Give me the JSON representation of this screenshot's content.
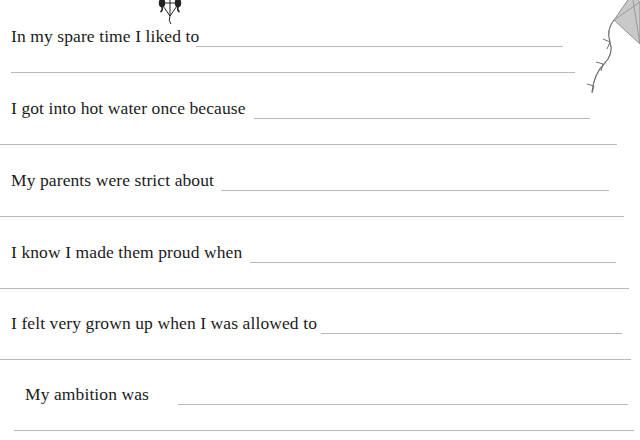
{
  "document": {
    "type": "fill-in-the-blank memory journal page",
    "page_background": "#ffffff",
    "text_color": "#1b1b1b",
    "rule_color": "#b9b9b9",
    "artwork": [
      {
        "name": "kite-small",
        "description": "small black-and-white kite with tail at top center"
      },
      {
        "name": "kite-corner",
        "description": "large grey kite with string in top right corner"
      }
    ],
    "prompts": [
      {
        "id": "spare-time",
        "label": "In my spare time I liked to",
        "label_width": 193,
        "rule_start": 196,
        "rule_end": 563,
        "second_rule": {
          "start": 11,
          "end": 575
        }
      },
      {
        "id": "hot-water",
        "label": "I got into hot water once because",
        "label_width": 241,
        "rule_start": 254,
        "rule_end": 590,
        "second_rule": {
          "start": 0,
          "end": 617
        }
      },
      {
        "id": "parents-strict",
        "label": "My parents were strict about",
        "label_width": 207,
        "rule_start": 221,
        "rule_end": 609,
        "second_rule": {
          "start": 0,
          "end": 624
        }
      },
      {
        "id": "made-them-proud",
        "label": "I know I made them proud when",
        "label_width": 240,
        "rule_start": 250,
        "rule_end": 616,
        "second_rule": {
          "start": 0,
          "end": 629
        }
      },
      {
        "id": "grown-up",
        "label": "I felt very grown up when I was allowed to",
        "label_width": 307,
        "rule_start": 321,
        "rule_end": 622,
        "second_rule": {
          "start": 0,
          "end": 631
        }
      },
      {
        "id": "ambition",
        "label": "My ambition was",
        "label_width": 140,
        "indent": 25,
        "rule_start": 178,
        "rule_end": 628,
        "second_rule": {
          "start": 14,
          "end": 634
        }
      }
    ]
  }
}
